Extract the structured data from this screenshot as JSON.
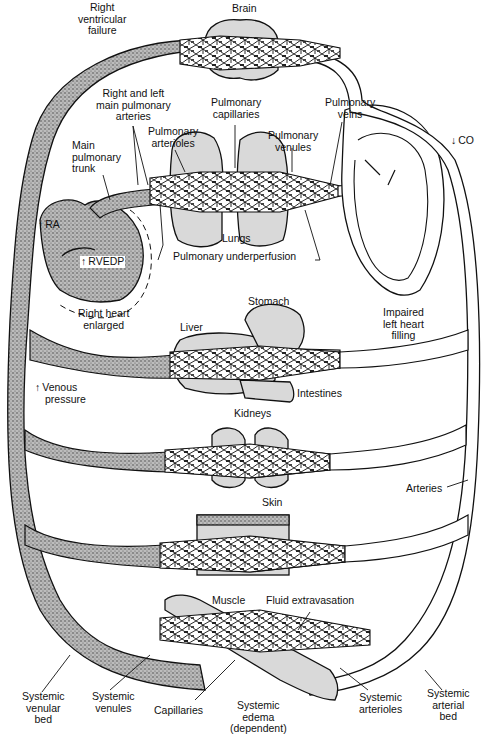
{
  "colors": {
    "ink": "#111111",
    "venous_stipple": "#8a8a8a",
    "organ_fill": "#d9d9d9",
    "background": "#ffffff"
  },
  "labels": {
    "right_ventricular_failure": [
      "Right",
      "ventricular",
      "failure"
    ],
    "brain": "Brain",
    "right_left_main_pulmonary_arteries": [
      "Right and left",
      "main pulmonary",
      "arteries"
    ],
    "pulmonary_capillaries": [
      "Pulmonary",
      "capillaries"
    ],
    "pulmonary_veins": [
      "Pulmonary",
      "veins"
    ],
    "pulmonary_arterioles": [
      "Pulmonary",
      "arterioles"
    ],
    "pulmonary_venules": [
      "Pulmonary",
      "venules"
    ],
    "main_pulmonary_trunk": [
      "Main",
      "pulmonary",
      "trunk"
    ],
    "co": "CO",
    "ra": "RA",
    "rvedp": "RVEDP",
    "lungs": "Lungs",
    "pulmonary_underperfusion": "Pulmonary underperfusion",
    "right_heart_enlarged": [
      "Right heart",
      "enlarged"
    ],
    "stomach": "Stomach",
    "liver": "Liver",
    "impaired_left_heart_filling": [
      "Impaired",
      "left heart",
      "filling"
    ],
    "venous_pressure": [
      "Venous",
      "pressure"
    ],
    "intestines": "Intestines",
    "kidneys": "Kidneys",
    "arteries": "Arteries",
    "skin": "Skin",
    "muscle": "Muscle",
    "fluid_extravasation": "Fluid extravasation",
    "systemic_venular_bed": [
      "Systemic",
      "venular",
      "bed"
    ],
    "systemic_venules": [
      "Systemic",
      "venules"
    ],
    "capillaries": "Capillaries",
    "systemic_edema": [
      "Systemic",
      "edema",
      "(dependent)"
    ],
    "systemic_arterioles": [
      "Systemic",
      "arterioles"
    ],
    "systemic_arterial_bed": [
      "Systemic",
      "arterial",
      "bed"
    ]
  },
  "indicators": {
    "co": "decreased",
    "ra": "increased",
    "rvedp": "increased",
    "venous_pressure": "increased"
  }
}
